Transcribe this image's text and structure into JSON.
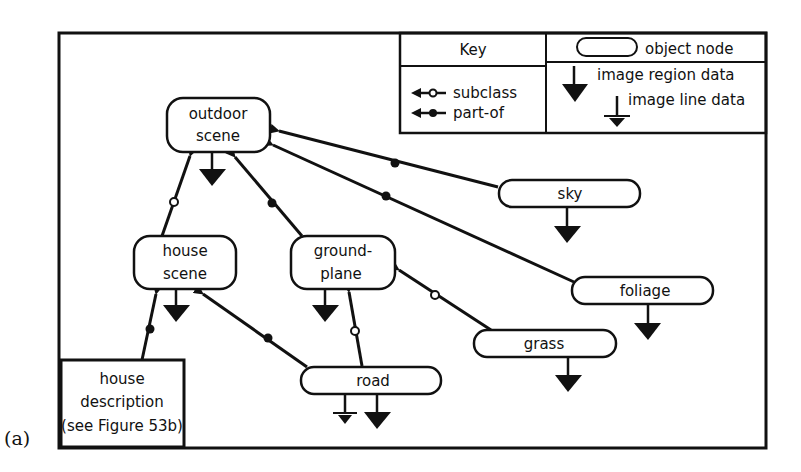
{
  "figure": {
    "panel_label": "(a)"
  },
  "key": {
    "title": "Key",
    "object_node_label": "object  node",
    "subclass_label": "subclass",
    "part_of_label": "part-of",
    "image_region_label": "image region data",
    "image_line_label": "image line data"
  },
  "nodes": {
    "outdoor_scene": {
      "line1": "outdoor",
      "line2": "scene"
    },
    "house_scene": {
      "line1": "house",
      "line2": "scene"
    },
    "ground_plane": {
      "line1": "ground-",
      "line2": "plane"
    },
    "sky": {
      "label": "sky"
    },
    "foliage": {
      "label": "foliage"
    },
    "grass": {
      "label": "grass"
    },
    "road": {
      "label": "road"
    },
    "house_description": {
      "line1": "house",
      "line2": "description",
      "line3": "(see Figure 53b)"
    }
  },
  "edges": [
    {
      "from": "house scene",
      "to": "outdoor scene",
      "type": "subclass"
    },
    {
      "from": "ground-plane",
      "to": "outdoor scene",
      "type": "part-of"
    },
    {
      "from": "sky",
      "to": "outdoor scene",
      "type": "part-of"
    },
    {
      "from": "foliage",
      "to": "outdoor scene",
      "type": "part-of"
    },
    {
      "from": "house description",
      "to": "house scene",
      "type": "part-of"
    },
    {
      "from": "road",
      "to": "house scene",
      "type": "part-of"
    },
    {
      "from": "road",
      "to": "ground-plane",
      "type": "subclass"
    },
    {
      "from": "grass",
      "to": "ground-plane",
      "type": "subclass"
    }
  ]
}
